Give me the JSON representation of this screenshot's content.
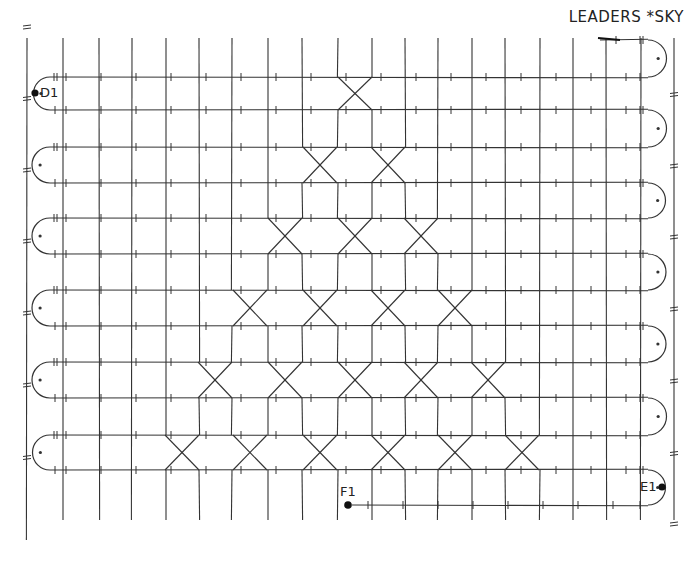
{
  "title": "LEADERS *SKY",
  "diagram": {
    "type": "bobbin-lace-pricking",
    "stroke_color": "#333333",
    "grid": {
      "vertical_x": [
        27,
        63,
        99,
        132,
        166,
        199,
        232,
        268,
        302,
        338,
        372,
        405,
        438,
        472,
        505,
        540,
        573,
        606,
        641,
        674
      ],
      "vertical_top": 38,
      "vertical_bottom": 520,
      "row_y": [
        40,
        77,
        110,
        147,
        183,
        218,
        254,
        290,
        326,
        362,
        398,
        435,
        470,
        505
      ],
      "path_left": 50,
      "path_right": 648
    },
    "crossing_bands": [
      {
        "rows": [
          1,
          2
        ],
        "centers": [
          355
        ]
      },
      {
        "rows": [
          3,
          4
        ],
        "centers": [
          320,
          388
        ]
      },
      {
        "rows": [
          5,
          6
        ],
        "centers": [
          285,
          355,
          421
        ]
      },
      {
        "rows": [
          7,
          8
        ],
        "centers": [
          250,
          320,
          388,
          455
        ]
      },
      {
        "rows": [
          9,
          10
        ],
        "centers": [
          215,
          285,
          355,
          421,
          488
        ]
      },
      {
        "rows": [
          11,
          12
        ],
        "centers": [
          182,
          250,
          320,
          388,
          455,
          522
        ]
      }
    ],
    "labels": [
      {
        "text": "D1",
        "x": 40,
        "y": 93,
        "dot": "left"
      },
      {
        "text": "E1",
        "x": 640,
        "y": 487,
        "dot": "right"
      },
      {
        "text": "F1",
        "x": 345,
        "y": 490,
        "dot": "below"
      }
    ]
  }
}
